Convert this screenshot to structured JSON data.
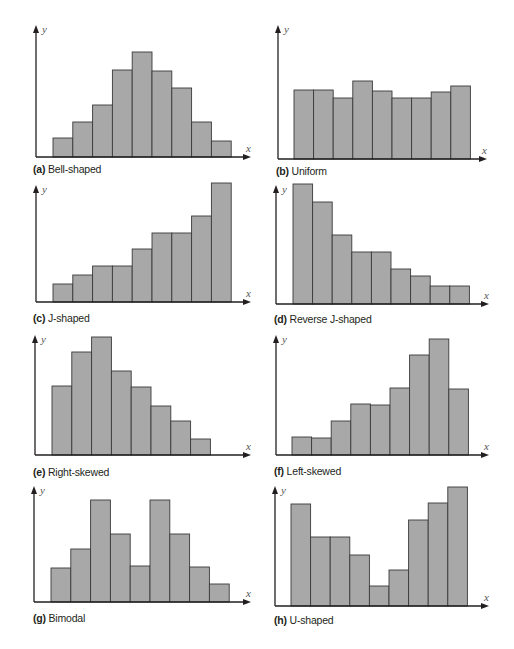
{
  "colors": {
    "bar_fill": "#a8a8a8",
    "bar_stroke": "#3a3a3a",
    "axis": "#231f20",
    "background": "#ffffff"
  },
  "chart_data": [
    {
      "id": "a",
      "type": "bar",
      "title": "Bell-shaped",
      "letter": "(a)",
      "xlabel": "x",
      "ylabel": "y",
      "categories": [
        "1",
        "2",
        "3",
        "4",
        "5",
        "6",
        "7",
        "8",
        "9"
      ],
      "values": [
        19,
        35,
        52,
        87,
        105,
        86,
        69,
        35,
        16
      ],
      "grid": false,
      "ticks": false
    },
    {
      "id": "b",
      "type": "bar",
      "title": "Uniform",
      "letter": "(b)",
      "xlabel": "x",
      "ylabel": "y",
      "categories": [
        "1",
        "2",
        "3",
        "4",
        "5",
        "6",
        "7",
        "8",
        "9"
      ],
      "values": [
        69,
        69,
        61,
        78,
        68,
        61,
        61,
        67,
        73
      ],
      "grid": false,
      "ticks": false
    },
    {
      "id": "c",
      "type": "bar",
      "title": "J-shaped",
      "letter": "(c)",
      "xlabel": "x",
      "ylabel": "y",
      "categories": [
        "1",
        "2",
        "3",
        "4",
        "5",
        "6",
        "7",
        "8",
        "9"
      ],
      "values": [
        18,
        27,
        36,
        36,
        53,
        69,
        69,
        86,
        119
      ],
      "grid": false,
      "ticks": false
    },
    {
      "id": "d",
      "type": "bar",
      "title": "Reverse J-shaped",
      "letter": "(d)",
      "xlabel": "x",
      "ylabel": "y",
      "categories": [
        "1",
        "2",
        "3",
        "4",
        "5",
        "6",
        "7",
        "8",
        "9"
      ],
      "values": [
        120,
        102,
        69,
        52,
        52,
        35,
        28,
        18,
        18
      ],
      "grid": false,
      "ticks": false
    },
    {
      "id": "e",
      "type": "bar",
      "title": "Right-skewed",
      "letter": "(e)",
      "xlabel": "x",
      "ylabel": "y",
      "categories": [
        "1",
        "2",
        "3",
        "4",
        "5",
        "6",
        "7",
        "8"
      ],
      "values": [
        69,
        103,
        118,
        84,
        68,
        49,
        34,
        16
      ],
      "grid": false,
      "ticks": false
    },
    {
      "id": "f",
      "type": "bar",
      "title": "Left-skewed",
      "letter": "(f)",
      "xlabel": "x",
      "ylabel": "y",
      "categories": [
        "1",
        "2",
        "3",
        "4",
        "5",
        "6",
        "7",
        "8",
        "9"
      ],
      "values": [
        18,
        17,
        34,
        51,
        50,
        67,
        100,
        116,
        66
      ],
      "grid": false,
      "ticks": false
    },
    {
      "id": "g",
      "type": "bar",
      "title": "Bimodal",
      "letter": "(g)",
      "xlabel": "x",
      "ylabel": "y",
      "categories": [
        "1",
        "2",
        "3",
        "4",
        "5",
        "6",
        "7",
        "8",
        "9"
      ],
      "values": [
        34,
        53,
        102,
        68,
        36,
        102,
        68,
        35,
        18
      ],
      "grid": false,
      "ticks": false
    },
    {
      "id": "h",
      "type": "bar",
      "title": "U-shaped",
      "letter": "(h)",
      "xlabel": "x",
      "ylabel": "y",
      "categories": [
        "1",
        "2",
        "3",
        "4",
        "5",
        "6",
        "7",
        "8",
        "9"
      ],
      "values": [
        102,
        69,
        69,
        51,
        20,
        36,
        86,
        103,
        119
      ],
      "grid": false,
      "ticks": false
    }
  ]
}
